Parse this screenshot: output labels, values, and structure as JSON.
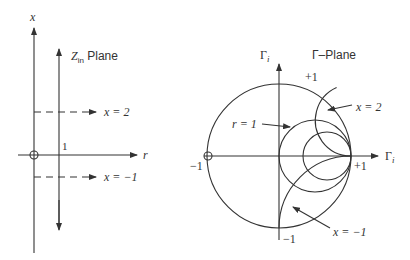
{
  "left_panel": {
    "title_main": "Z",
    "title_sub": "in",
    "title_suffix": " Plane",
    "vertical_axis_label": "x",
    "horizontal_axis_label": "r",
    "unit_tick_label": "1",
    "reactance_line_pos_label": "x = 2",
    "reactance_line_neg_label": "x = −1"
  },
  "right_panel": {
    "title": "Γ–Plane",
    "vertical_axis_label": "Γ",
    "vertical_axis_sub": "i",
    "horizontal_axis_label": "Γ",
    "horizontal_axis_sub": "i",
    "top_label": "+1",
    "bottom_label": "−1",
    "left_label": "−1",
    "right_label": "+1",
    "r1_label": "r = 1",
    "x2_label": "x = 2",
    "xneg1_label": "x = −1"
  },
  "colors": {
    "stroke": "#333333",
    "background": "#ffffff"
  }
}
